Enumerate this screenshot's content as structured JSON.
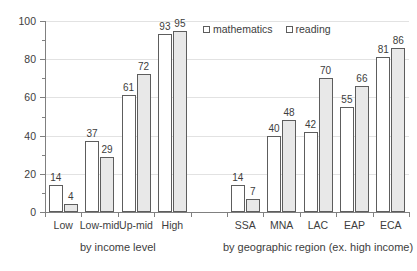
{
  "chart_data": {
    "type": "bar",
    "title": "",
    "subtitle": "",
    "xlabel": "",
    "ylabel": "",
    "ylim": [
      0,
      100
    ],
    "ytick_values": [
      0,
      20,
      40,
      60,
      80,
      100
    ],
    "ytick_labels": [
      "0",
      "20",
      "40",
      "60",
      "80",
      "100"
    ],
    "yminor_step": 10,
    "grid": true,
    "legend_position": "top-right",
    "categories": [
      "Low",
      "Low-mid",
      "Up-mid",
      "High",
      "SSA",
      "MNA",
      "LAC",
      "EAP",
      "ECA"
    ],
    "series": [
      {
        "name": "mathematics",
        "color": "#ffffff",
        "edge_color": "#5d5d5d",
        "values": [
          14,
          37,
          61,
          93,
          14,
          40,
          42,
          55,
          81
        ]
      },
      {
        "name": "reading",
        "color": "#e8e8e8",
        "edge_color": "#5d5d5d",
        "values": [
          4,
          29,
          72,
          95,
          7,
          48,
          70,
          66,
          86
        ]
      }
    ],
    "sections": [
      {
        "label": "by income level",
        "categories": [
          "Low",
          "Low-mid",
          "Up-mid",
          "High"
        ]
      },
      {
        "label": "by geographic region (ex. high income)",
        "categories": [
          "SSA",
          "MNA",
          "LAC",
          "EAP",
          "ECA"
        ]
      }
    ],
    "data_labels": [
      {
        "category": "Low",
        "series": "mathematics",
        "value": 14
      },
      {
        "category": "Low",
        "series": "reading",
        "value": 4
      },
      {
        "category": "Low-mid",
        "series": "mathematics",
        "value": 37
      },
      {
        "category": "Low-mid",
        "series": "reading",
        "value": 29
      },
      {
        "category": "Up-mid",
        "series": "mathematics",
        "value": 61
      },
      {
        "category": "Up-mid",
        "series": "reading",
        "value": 72
      },
      {
        "category": "High",
        "series": "mathematics",
        "value": 93
      },
      {
        "category": "High",
        "series": "reading",
        "value": 95
      },
      {
        "category": "SSA",
        "series": "mathematics",
        "value": 14
      },
      {
        "category": "SSA",
        "series": "reading",
        "value": 7
      },
      {
        "category": "MNA",
        "series": "mathematics",
        "value": 40
      },
      {
        "category": "MNA",
        "series": "reading",
        "value": 48
      },
      {
        "category": "LAC",
        "series": "mathematics",
        "value": 42
      },
      {
        "category": "LAC",
        "series": "reading",
        "value": 70
      },
      {
        "category": "EAP",
        "series": "mathematics",
        "value": 55
      },
      {
        "category": "EAP",
        "series": "reading",
        "value": 66
      },
      {
        "category": "ECA",
        "series": "mathematics",
        "value": 81
      },
      {
        "category": "ECA",
        "series": "reading",
        "value": 86
      }
    ]
  },
  "legend": {
    "items": [
      {
        "label": "mathematics"
      },
      {
        "label": "reading"
      }
    ]
  },
  "axis": {
    "y_labels": [
      "100",
      "80",
      "60",
      "40",
      "20",
      "0"
    ]
  }
}
